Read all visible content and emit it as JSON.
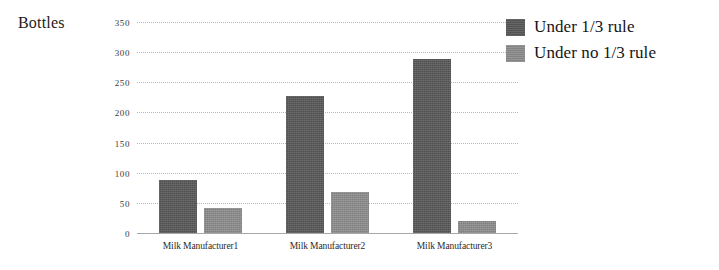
{
  "chart_data": {
    "type": "bar",
    "title": "",
    "subtitle": "",
    "xlabel": "",
    "ylabel": "Bottles",
    "ylim": [
      0,
      350
    ],
    "y_ticks": [
      0,
      50,
      100,
      150,
      200,
      250,
      300,
      350
    ],
    "y_tick_labels": [
      "0",
      "50",
      "100",
      "150",
      "200",
      "250",
      "300",
      "350"
    ],
    "grid": true,
    "grid_axis": "y",
    "legend_position": "right-top",
    "categories": [
      "Milk Manufacturer1",
      "Milk Manufacturer2",
      "Milk Manufacturer3"
    ],
    "series": [
      {
        "name": "Under 1/3 rule",
        "color": "#585858",
        "values": [
          88,
          228,
          288
        ]
      },
      {
        "name": "Under no 1/3 rule",
        "color": "#8c8c8c",
        "values": [
          42,
          68,
          20
        ]
      }
    ]
  },
  "axis": {
    "y_title": "Bottles"
  },
  "legend": {
    "entries": [
      {
        "label": "Under 1/3 rule",
        "swatch": "legend-swatch-dark"
      },
      {
        "label": "Under no 1/3 rule",
        "swatch": "legend-swatch-light"
      }
    ]
  }
}
